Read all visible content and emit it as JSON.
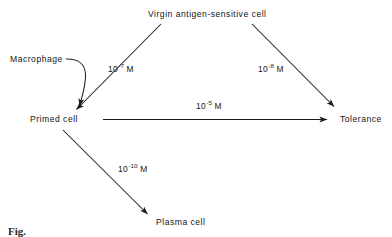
{
  "diagram": {
    "type": "flow-diagram",
    "line_color": "#1c1c1c",
    "text_color": "#151515",
    "background": "#ffffff",
    "nodes": [
      {
        "id": "virgin",
        "label": "Virgin antigen-sensitive cell",
        "x": 210,
        "y": 14
      },
      {
        "id": "macrophage",
        "label": "Macrophage",
        "x": 34,
        "y": 62
      },
      {
        "id": "primed",
        "label": "Primed cell",
        "x": 55,
        "y": 120
      },
      {
        "id": "tolerance",
        "label": "Tolerance",
        "x": 358,
        "y": 120
      },
      {
        "id": "plasma",
        "label": "Plasma cell",
        "x": 186,
        "y": 223
      }
    ],
    "edges": [
      {
        "id": "virgin-to-primed",
        "from": "virgin",
        "to": "primed",
        "label_mantissa": "10",
        "label_exponent": "-7",
        "label_unit": "M",
        "label_x": 112,
        "label_y": 68
      },
      {
        "id": "virgin-to-tolerance",
        "from": "virgin",
        "to": "tolerance",
        "label_mantissa": "10",
        "label_exponent": "-8",
        "label_unit": "M",
        "label_x": 262,
        "label_y": 68
      },
      {
        "id": "primed-to-tolerance",
        "from": "primed",
        "to": "tolerance",
        "label_mantissa": "10",
        "label_exponent": "-5",
        "label_unit": "M",
        "label_x": 200,
        "label_y": 104
      },
      {
        "id": "primed-to-plasma",
        "from": "primed",
        "to": "plasma",
        "label_mantissa": "10",
        "label_exponent": "-10",
        "label_unit": "M",
        "label_x": 124,
        "label_y": 168
      },
      {
        "id": "macrophage-to-primed",
        "from": "macrophage",
        "to": "primed",
        "label_mantissa": "",
        "label_exponent": "",
        "label_unit": "",
        "label_x": 0,
        "label_y": 0
      }
    ],
    "caption": "Fig."
  }
}
